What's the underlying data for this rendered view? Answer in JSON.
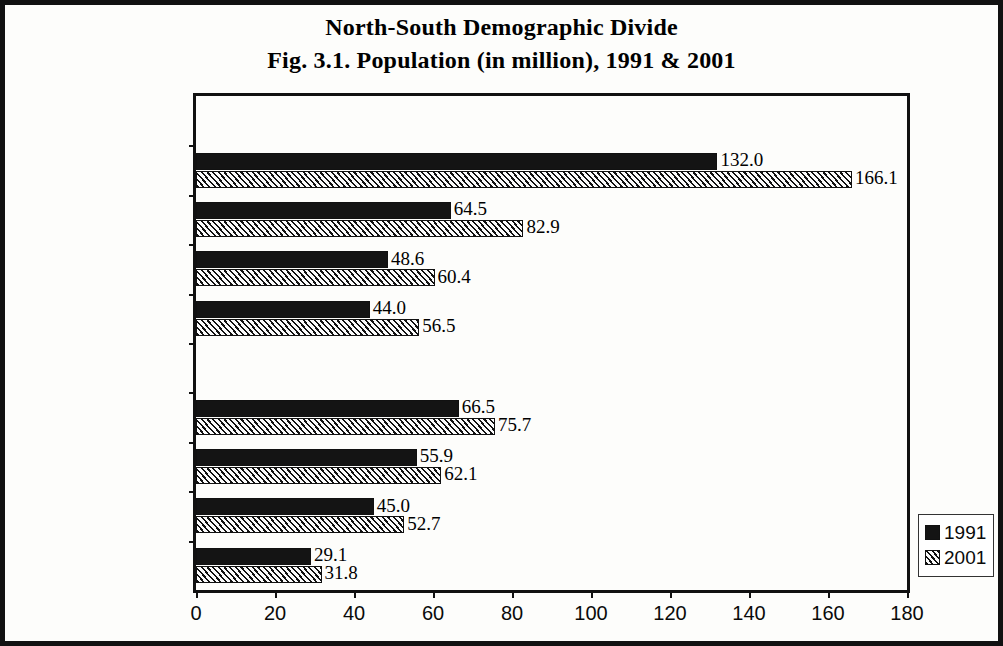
{
  "figure": {
    "title_line1": "North-South Demographic Divide",
    "title_line2": "Fig. 3.1. Population (in million), 1991 & 2001",
    "frame_color": "#111111"
  },
  "legend": {
    "position": "right-outside-bottom",
    "entries": [
      {
        "label": "1991",
        "swatch": "solid-black-swatch",
        "color": "#141414"
      },
      {
        "label": "2001",
        "swatch": "diagonal-hatch-swatch",
        "color": "#111111"
      }
    ]
  },
  "chart_data": {
    "type": "bar",
    "orientation": "horizontal",
    "title": "North-South Demographic Divide\nFig. 3.1. Population (in million), 1991 & 2001",
    "xlabel": "",
    "ylabel": "",
    "xlim": [
      0,
      180
    ],
    "xticks": [
      0,
      20,
      40,
      60,
      80,
      100,
      120,
      140,
      160,
      180
    ],
    "grid": false,
    "legend_position": "right",
    "categories": [
      "NORTH",
      "Uttar Pradesh",
      "Bihar",
      "Madhya Pradesh",
      "Rajasthan",
      "SOUTH",
      "Andhra Pradesh",
      "Tamil Nadu",
      "Karnataka",
      "Kerala"
    ],
    "category_is_header": [
      true,
      false,
      false,
      false,
      false,
      true,
      false,
      false,
      false,
      false
    ],
    "series": [
      {
        "name": "1991",
        "values": [
          null,
          132.0,
          64.5,
          48.6,
          44.0,
          null,
          66.5,
          55.9,
          45.0,
          29.1
        ],
        "labels": [
          "",
          "132.0",
          "64.5",
          "48.6",
          "44.0",
          "",
          "66.5",
          "55.9",
          "45.0",
          "29.1"
        ]
      },
      {
        "name": "2001",
        "values": [
          null,
          166.1,
          82.9,
          60.4,
          56.5,
          null,
          75.7,
          62.1,
          52.7,
          31.8
        ],
        "labels": [
          "",
          "166.1",
          "82.9",
          "60.4",
          "56.5",
          "",
          "75.7",
          "62.1",
          "52.7",
          "31.8"
        ]
      }
    ]
  }
}
